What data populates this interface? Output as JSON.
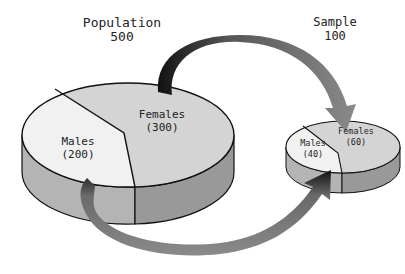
{
  "population": {
    "title": "Population",
    "total": "500",
    "slices": [
      {
        "label": "Males",
        "value": "(200)"
      },
      {
        "label": "Females",
        "value": "(300)"
      }
    ]
  },
  "sample": {
    "title": "Sample",
    "total": "100",
    "slices": [
      {
        "label": "Males",
        "value": "(40)"
      },
      {
        "label": "Females",
        "value": "(60)"
      }
    ]
  },
  "colors": {
    "males_top": "#f1f1f1",
    "females_top": "#d4d4d4",
    "males_side": "#b4b4b4",
    "females_side": "#999999",
    "arrow_gray": "#8a8a8a",
    "arrow_dark": "#111111",
    "outline": "#111111"
  }
}
